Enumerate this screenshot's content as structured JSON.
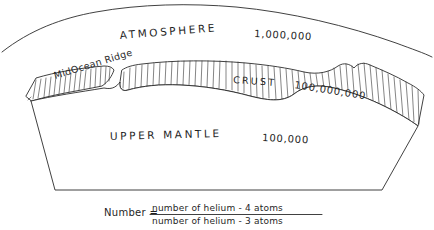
{
  "figure": {
    "ink_color": "#2b2b2b",
    "background_color": "#ffffff"
  },
  "layers": {
    "atmosphere": {
      "label": "ATMOSPHERE",
      "value": "1,000,000"
    },
    "crust": {
      "label": "CRUST",
      "value": "100,000,000"
    },
    "upper_mantle": {
      "label": "UPPER MANTLE",
      "value": "100,000"
    }
  },
  "annotations": {
    "mid_ocean_ridge": "MidOcean Ridge"
  },
  "formula": {
    "lead": "Number =",
    "numerator": "number of helium - 4 atoms",
    "denominator": "number of helium - 3 atoms"
  }
}
